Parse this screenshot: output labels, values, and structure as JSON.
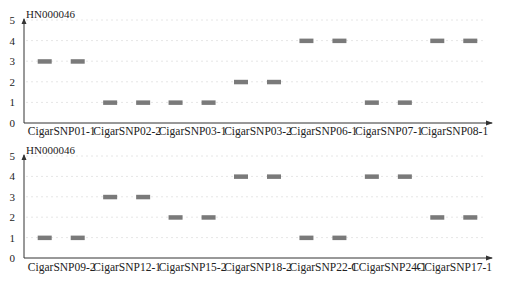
{
  "chart_data": [
    {
      "type": "scatter",
      "title": "HN000046",
      "xlabel": "",
      "ylabel": "",
      "ylim": [
        0,
        5
      ],
      "yticks": [
        0,
        1,
        2,
        3,
        4,
        5
      ],
      "grid": "faint horizontal dotted",
      "marker": "horizontal bar (two replicates per category)",
      "categories": [
        "CigarSNP01-1",
        "CigarSNP02-2",
        "CigarSNP03-1",
        "CigarSNP03-2",
        "CigarSNP06-1",
        "CigarSNP07-1",
        "CigarSNP08-1"
      ],
      "values": [
        3,
        1,
        1,
        2,
        4,
        1,
        4
      ],
      "replicates": [
        [
          3,
          3
        ],
        [
          1,
          1
        ],
        [
          1,
          1
        ],
        [
          2,
          2
        ],
        [
          4,
          4
        ],
        [
          1,
          1
        ],
        [
          4,
          4
        ]
      ]
    },
    {
      "type": "scatter",
      "title": "HN000046",
      "xlabel": "",
      "ylabel": "",
      "ylim": [
        0,
        5
      ],
      "yticks": [
        0,
        1,
        2,
        3,
        4,
        5
      ],
      "grid": "faint horizontal dotted",
      "marker": "horizontal bar (two replicates per category)",
      "categories": [
        "CigarSNP09-2",
        "CigarSNP12-1",
        "CigarSNP15-2",
        "CigarSNP18-2",
        "CigarSNP22-1",
        "CCigarSNP24-1",
        "CCigarSNP17-1"
      ],
      "values": [
        1,
        3,
        2,
        4,
        1,
        4,
        2
      ],
      "replicates": [
        [
          1,
          1
        ],
        [
          3,
          3
        ],
        [
          2,
          2
        ],
        [
          4,
          4
        ],
        [
          1,
          1
        ],
        [
          4,
          4
        ],
        [
          2,
          2
        ]
      ]
    }
  ],
  "style": {
    "bar_color": "#7a7a7a",
    "axis_color": "#333333",
    "grid_color": "#e6e6e6"
  }
}
